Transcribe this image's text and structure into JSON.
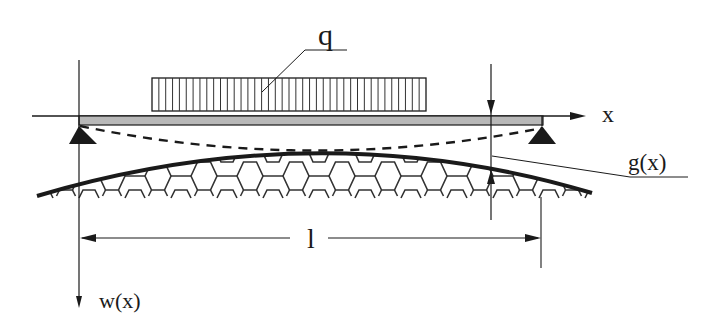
{
  "diagram": {
    "labels": {
      "load": "q",
      "x_axis": "x",
      "w_axis": "w(x)",
      "gap": "g(x)",
      "span": "l"
    },
    "colors": {
      "line": "#1a1a1a",
      "beam_fill": "#b8b8b8",
      "background": "#ffffff"
    },
    "load_block": {
      "x_start": 152,
      "x_end": 426,
      "hatch_count": 40
    },
    "foundation_cells": 11
  }
}
